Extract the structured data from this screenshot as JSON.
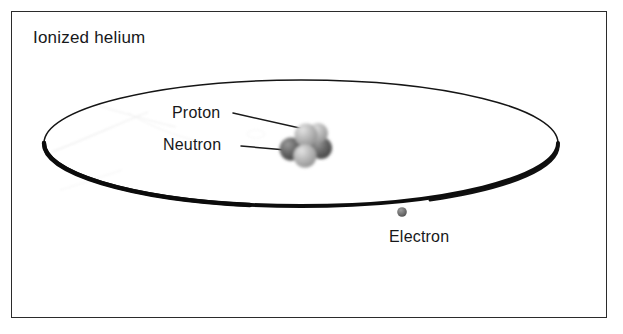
{
  "figure": {
    "title": "Ionized helium",
    "background_color": "#ffffff",
    "frame": {
      "border_color": "#2b2b2b",
      "x": 11,
      "y": 11,
      "width": 596,
      "height": 307
    }
  },
  "labels": {
    "title": "Ionized helium",
    "proton": "Proton",
    "neutron": "Neutron",
    "electron": "Electron"
  },
  "orbit": {
    "name": "electron-orbit",
    "shape": "ellipse",
    "center_x": 301,
    "center_y": 143,
    "radius_x": 257,
    "radius_y": 63,
    "stroke_color": "#111111",
    "stroke_min_width": 1.4,
    "stroke_max_width": 4.2
  },
  "nucleus": {
    "center_x": 305,
    "center_y": 144,
    "particles": [
      {
        "kind": "neutron",
        "label": "Neutron",
        "cx": 291,
        "cy": 149,
        "r": 11,
        "color": "#5d5d5d"
      },
      {
        "kind": "neutron",
        "label": "Neutron",
        "cx": 320,
        "cy": 148,
        "r": 11,
        "color": "#6a6a6a"
      },
      {
        "kind": "proton",
        "label": "Proton",
        "cx": 306,
        "cy": 135,
        "r": 11,
        "color": "#b3b3b3"
      },
      {
        "kind": "proton",
        "label": "Proton",
        "cx": 305,
        "cy": 155,
        "r": 11,
        "color": "#a9a9a9"
      },
      {
        "kind": "proton",
        "label": "Proton",
        "cx": 318,
        "cy": 134,
        "r": 10,
        "color": "#c2c2c2"
      }
    ]
  },
  "electron": {
    "label": "Electron",
    "cx": 402,
    "cy": 212,
    "r": 4.6,
    "color": "#6e6e6e"
  },
  "leader_lines": [
    {
      "name": "proton-leader",
      "x1": 233,
      "y1": 113,
      "x2": 312,
      "y2": 131
    },
    {
      "name": "neutron-leader",
      "x1": 241,
      "y1": 146,
      "x2": 285,
      "y2": 150
    }
  ],
  "colors": {
    "ink": "#17181a",
    "orbit": "#111111",
    "neutron": "#5d5d5d",
    "proton": "#b3b3b3",
    "electron": "#6e6e6e"
  }
}
